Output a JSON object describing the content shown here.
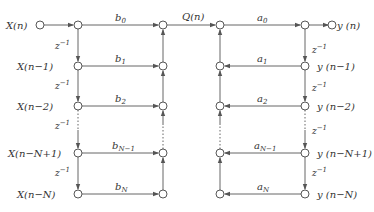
{
  "diagram": {
    "type": "direct-form-II signal flow graph",
    "input_label": "X(n)",
    "output_label": "y (n)",
    "middle_label": "Q(n)",
    "delay_label": "z",
    "delay_exp": "−1",
    "left_labels": [
      "X(n−1)",
      "X(n−2)",
      "X(n−N+1)",
      "X(n−N)"
    ],
    "right_labels": [
      "y (n−1)",
      "y (n−2)",
      "y (n−N+1)",
      "y (n−N)"
    ],
    "b_coeffs": [
      {
        "base": "b",
        "sub": "0"
      },
      {
        "base": "b",
        "sub": "1"
      },
      {
        "base": "b",
        "sub": "2"
      },
      {
        "base": "b",
        "sub": "N−1"
      },
      {
        "base": "b",
        "sub": "N"
      }
    ],
    "a_coeffs": [
      {
        "base": "a",
        "sub": "0"
      },
      {
        "base": "a",
        "sub": "1"
      },
      {
        "base": "a",
        "sub": "2"
      },
      {
        "base": "a",
        "sub": "N−1"
      },
      {
        "base": "a",
        "sub": "N"
      }
    ]
  }
}
